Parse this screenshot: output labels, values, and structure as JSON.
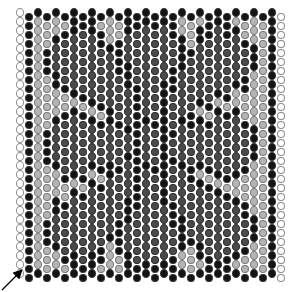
{
  "chart": {
    "columns": 30,
    "rows": 30,
    "origin_x": 16,
    "origin_y": 8,
    "bead_pitch_x": 9,
    "bead_pitch_y": 9,
    "odd_column_offset": 4.5,
    "colors": {
      "W": "#ffffff",
      "K": "#141414",
      "L": "#b4b4b4",
      "D": "#4a4a4a"
    },
    "outline_colors": {
      "W": "#8c8c8c",
      "K": "#3a3a3a",
      "L": "#7a7a7a",
      "D": "#2e2e2e"
    },
    "legend": [
      {
        "code": "W",
        "label": "white bead"
      },
      {
        "code": "K",
        "label": "black bead"
      },
      {
        "code": "L",
        "label": "light gray bead"
      },
      {
        "code": "D",
        "label": "dark gray bead"
      }
    ],
    "grid": [
      "WKKKKKKKKKKKKKKKKKKKKKKKKKKKKW",
      "WKLLLLKKKLLLKKKKKKLLLKKKLLLLKW",
      "WKLLLKKDKKLLKDDDDKLLKKDKKLLLKW",
      "WKLLKDDDDKLKDDDDDDKLKDDDDKLLKW",
      "WKLKDDDDDDKKDDDDDDKKDDDDDDKLKW",
      "WKLKDDDDDDDKDDDDDDKDDDDDDDKLKW",
      "WKLKDDDDDDDKKDDDDKKDDDDDDDKLKW",
      "WKLLKDDDDDDDKDDDDKDDDDDDDKLLKW",
      "WKLLKKDDDDDDKKDDKKDDDDDDKKLLKW",
      "WKLLLLKKDDDDDKDDKDDDDDKKLLLLKW",
      "WKLLLLLLKKDDDKDDKDDDKKLLLLLLKW",
      "WKLLLKKKLLKDDKDDKDDKLLKKKLLLKW",
      "WKLLKDDDKKKKDKKKKDKKKKDDDKLLKW",
      "WKLKDDDDDDDDKKDDKKDDDDDDDDKLKW",
      "WKLKDDDDDDDDDKDDKDDDDDDDDDKLKW",
      "WKLKDDDDDDDDDKDDKDDDDDDDDDKLKW",
      "WKLKDDDDDDDDKKDDKKDDDDDDDDKLKW",
      "WKLLKDDDKKKKDKKKKDKKKKDDDKLLKW",
      "WKLLLKKKLLKDDKDDKDDKLLKKKLLLKW",
      "WKLLLLLLKKDDDKDDKDDDKKLLLLLLKW",
      "WKLLLLKKDDDDDKDDKDDDDDKKLLLLKW",
      "WKLLKKDDDDDDKKDDKKDDDDDDKKLLKW",
      "WKLLKDDDDDDDKDDDDKDDDDDDDKLLKW",
      "WKLKDDDDDDDKKDDDDKKDDDDDDDKLKW",
      "WKLKDDDDDDDKDDDDDDKDDDDDDDKLKW",
      "WKLKDDDDDDKKDDDDDDKKDDDDDDKLKW",
      "WKLLKDDDDKLKDDDDDDKLKDDDDKLLKW",
      "WKLLLKKDKKLLKDDDDKLLKKDKKLLLKW",
      "WKLLLLKKKLLLKKKKKKLLLKKKLLLLKW",
      "WKKKKKKKKKKKKKKKKKKKKKKKKKKKKW"
    ],
    "start_arrow": {
      "label": "start bead",
      "from": [
        2,
        290
      ],
      "to": [
        21,
        271
      ]
    }
  }
}
